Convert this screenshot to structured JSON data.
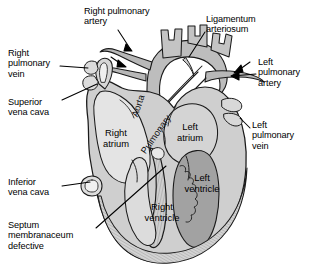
{
  "figure": {
    "width": 315,
    "height": 278,
    "background": "#ffffff"
  },
  "colors": {
    "outline": "#1a1a1a",
    "myocardium_fill": "#c9c9c9",
    "vessel_fill": "#bdbdbd",
    "chamber_light": "#e2e2e2",
    "chamber_mid": "#d2d2d2",
    "chamber_dark": "#9e9e9e",
    "lumen_white": "#f7f7f7",
    "text": "#000000",
    "leader": "#000000"
  },
  "callouts": [
    {
      "id": "right-pulmonary-artery",
      "text": "Right pulmonary\nartery",
      "x": 84,
      "y": 6,
      "align": "left"
    },
    {
      "id": "ligamentum-arteriosum",
      "text": "Ligamentum\narteriosum",
      "x": 206,
      "y": 14,
      "align": "left"
    },
    {
      "id": "right-pulmonary-vein",
      "text": "Right\npulmonary\nvein",
      "x": 8,
      "y": 48,
      "align": "left"
    },
    {
      "id": "left-pulmonary-artery",
      "text": "Left\npulmonary\nartery",
      "x": 258,
      "y": 57,
      "align": "left"
    },
    {
      "id": "superior-vena-cava",
      "text": "Superior\nvena cava",
      "x": 8,
      "y": 97,
      "align": "left"
    },
    {
      "id": "left-pulmonary-vein",
      "text": "Left\npulmonary\nvein",
      "x": 252,
      "y": 120,
      "align": "left"
    },
    {
      "id": "inferior-vena-cava",
      "text": "Inferior\nvena cava",
      "x": 8,
      "y": 177,
      "align": "left"
    },
    {
      "id": "septum-membranaceum-defective",
      "text": "Septum\nmembranaceum\ndefective",
      "x": 8,
      "y": 220,
      "align": "left"
    }
  ],
  "vessel_labels": [
    {
      "id": "aorta",
      "text": "Aorta",
      "x": 130,
      "y": 115,
      "rotation": -72
    },
    {
      "id": "pulmonary",
      "text": "Pulmonary",
      "x": 139,
      "y": 150,
      "rotation": -55
    }
  ],
  "chamber_labels": [
    {
      "id": "right-atrium",
      "text": "Right\natrium",
      "x": 92,
      "y": 128,
      "width": 48
    },
    {
      "id": "left-atrium",
      "text": "Left\natrium",
      "x": 170,
      "y": 122,
      "width": 40
    },
    {
      "id": "left-ventricle",
      "text": "Left\nventricle",
      "x": 176,
      "y": 173,
      "width": 52
    },
    {
      "id": "right-ventricle",
      "text": "Right\nventricle",
      "x": 136,
      "y": 202,
      "width": 52
    }
  ],
  "leader_lines": [
    {
      "id": "leader-right-pulmonary-artery",
      "from": [
        118,
        30
      ],
      "to": [
        131,
        50
      ]
    },
    {
      "id": "leader-ligamentum-arteriosum",
      "from": [
        204,
        33
      ],
      "to": [
        190,
        56
      ]
    },
    {
      "id": "leader-right-pulmonary-vein",
      "from": [
        60,
        66
      ],
      "to": [
        100,
        66
      ]
    },
    {
      "id": "leader-left-pulmonary-artery",
      "from": [
        256,
        74
      ],
      "to": [
        228,
        74
      ]
    },
    {
      "id": "leader-superior-vena-cava",
      "from": [
        62,
        100
      ],
      "to": [
        97,
        84
      ]
    },
    {
      "id": "leader-left-pulmonary-vein",
      "from": [
        250,
        128
      ],
      "to": [
        228,
        112
      ]
    },
    {
      "id": "leader-inferior-vena-cava",
      "from": [
        62,
        186
      ],
      "to": [
        92,
        181
      ]
    },
    {
      "id": "leader-septum-membranaceum",
      "from": [
        96,
        228
      ],
      "to": [
        170,
        168
      ]
    }
  ]
}
